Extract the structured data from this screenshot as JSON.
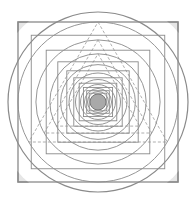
{
  "figure": {
    "colors": {
      "background": "#ffffff",
      "stroke": "#8a8a8a",
      "corner_fill": "#e6e6e6",
      "center_fill": "#a9a9a9",
      "dashed": "#9a9a9a"
    },
    "center": [
      98,
      102
    ],
    "outer_square_half": 80,
    "outer_circle_radius": 90,
    "levels": 9,
    "center_circle_radius": 8
  }
}
